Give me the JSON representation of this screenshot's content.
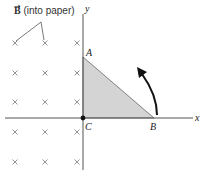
{
  "field_label": {
    "symbol": "B",
    "text": " (into paper)"
  },
  "axes": {
    "x_label": "x",
    "y_label": "y"
  },
  "points": {
    "A": {
      "label": "A"
    },
    "B": {
      "label": "B"
    },
    "C": {
      "label": "C"
    }
  },
  "colors": {
    "triangle_fill": "#d4d4d4",
    "axis": "#555555",
    "cross": "#888888",
    "arrow": "#111111"
  },
  "crosses": {
    "columns": [
      15,
      45,
      77
    ],
    "rows": [
      43,
      73,
      102,
      132,
      162
    ]
  }
}
